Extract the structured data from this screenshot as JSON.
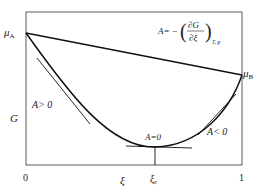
{
  "diagram": {
    "y_axis_label": "G",
    "x_axis_label": "ξ",
    "x_start": "0",
    "x_end": "1",
    "x_equilibrium": "ξ",
    "x_equilibrium_sub": "e",
    "mu_a": "μ",
    "mu_a_sub": "A",
    "mu_b": "μ",
    "mu_b_sub": "B",
    "formula_lhs": "A= −",
    "formula_num": "∂G",
    "formula_den": "∂ξ",
    "formula_sub": "T, p",
    "region_left": "A> 0",
    "region_min": "A=0",
    "region_right": "A< 0"
  }
}
